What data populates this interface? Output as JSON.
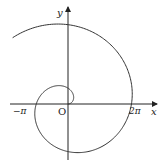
{
  "figure": {
    "type": "polar-curve",
    "axes": {
      "x_label": "x",
      "y_label": "y",
      "origin_label": "O",
      "ticks": [
        {
          "label": "−π",
          "value": -3.14159
        },
        {
          "label": "2π",
          "value": 6.28318
        }
      ]
    },
    "curve": {
      "equation": "r = θ",
      "theta_start": 0,
      "theta_end": 8.55
    },
    "colors": {
      "stroke": "#333333",
      "background": "#ffffff"
    }
  },
  "layout": {
    "origin_px": [
      68,
      104
    ],
    "scale_px_per_unit": 10.1
  }
}
